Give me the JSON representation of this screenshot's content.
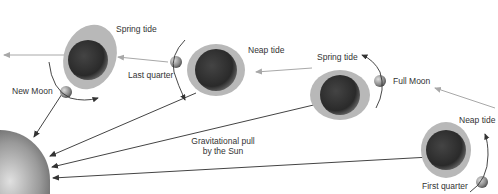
{
  "diagram": {
    "colors": {
      "background": "#ffffff",
      "text": "#333333",
      "tide_bulge": "#b8b8b8",
      "earth_dark": "#2a2a2a",
      "earth_light": "#9a9a9a",
      "sun_pull_arrow": "#444444",
      "moon_pull_arrow": "#a8a8a8",
      "orbit_arrow": "#333333"
    },
    "labels": {
      "spring_tide_1": "Spring tide",
      "new_moon": "New Moon",
      "last_quarter": "Last quarter",
      "neap_tide_1": "Neap tide",
      "spring_tide_2": "Spring tide",
      "full_moon": "Full Moon",
      "neap_tide_2": "Neap tide",
      "first_quarter": "First quarter",
      "gravity_line1": "Gravitational pull",
      "gravity_line2": "by the Sun"
    },
    "positions": [
      {
        "phase": "New Moon",
        "tide": "Spring tide"
      },
      {
        "phase": "Last quarter",
        "tide": "Neap tide"
      },
      {
        "phase": "Full Moon",
        "tide": "Spring tide"
      },
      {
        "phase": "First quarter",
        "tide": "Neap tide"
      }
    ],
    "sun_label": "Sun"
  }
}
